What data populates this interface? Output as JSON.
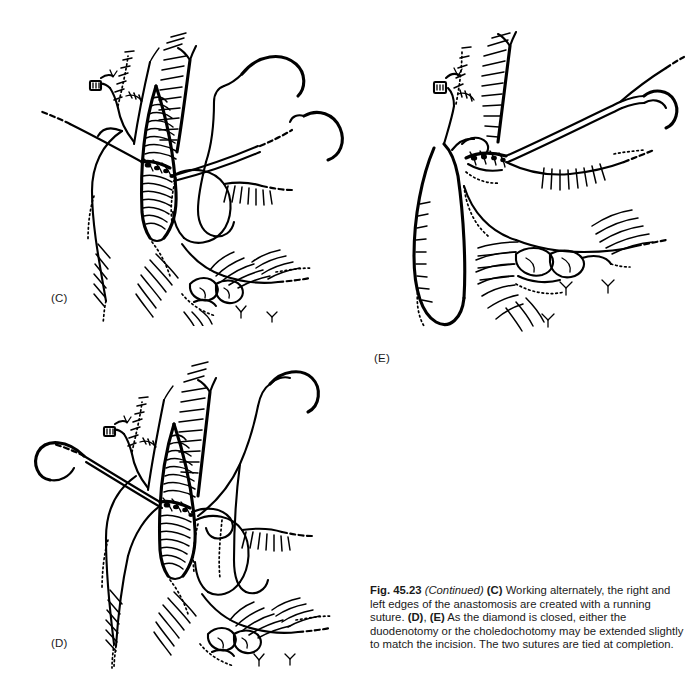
{
  "figure": {
    "number": "Fig. 45.23",
    "continued": "(Continued)",
    "caption_parts": {
      "label_c": "(C)",
      "text_1": " Working alternately, the right and left edges of the anastomosis are created with a running suture. ",
      "label_d": "(D)",
      "comma": ", ",
      "label_e": "(E)",
      "text_2": " As the diamond is closed, either the duodenotomy or the choledochotomy may be extended slightly to match the incision. The two sutures are tied at completion."
    },
    "caption_full": "Fig. 45.23 (Continued) (C) Working alternately, the right and left edges of the anastomosis are created with a running suture. (D), (E) As the diamond is closed, either the duodenotomy or the choledochotomy may be extended slightly to match the incision. The two sutures are tied at completion."
  },
  "panels": [
    {
      "id": "C",
      "label": "(C)",
      "title": "Running suture anastomosis in progress",
      "description": "Line drawing of a choledochoduodenostomy: the opened common bile duct shows a diamond-shaped choledochotomy with hatched mucosa, two curved surgical needles with suture strands enter from upper right and left, the duodenum is retracted below right."
    },
    {
      "id": "D",
      "label": "(D)",
      "title": "Diamond partially closed",
      "description": "Line drawing showing the diamond anastomosis being closed with two running sutures carried on curved needles held at the upper left and upper right."
    },
    {
      "id": "E",
      "label": "(E)",
      "title": "Anastomosis completed and sutures tied",
      "description": "Line drawing of the finished anastomosis; the choledochotomy is closed, the bile duct is collapsed and the two suture ends exit to the upper right with a single curved needle."
    }
  ],
  "colors": {
    "ink": "#000000",
    "background": "#ffffff",
    "text": "#1a1a1a"
  }
}
